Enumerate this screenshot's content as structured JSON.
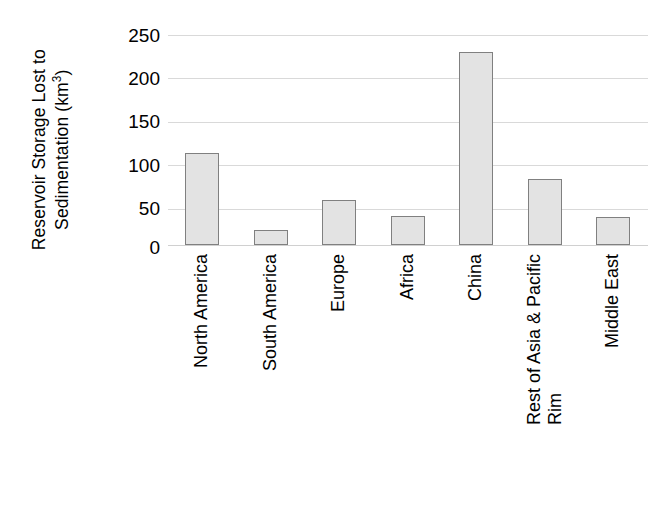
{
  "chart_data": {
    "type": "bar",
    "title": "",
    "subtitle": "",
    "xlabel": "",
    "ylabel": "Reservoir Storage Lost to Sedimentation (km3)",
    "ylabel_lines": [
      "Reservoir Storage Lost to",
      "Sedimentation (km"
    ],
    "ylabel_unit_exponent": "3",
    "ylabel_unit_close": ")",
    "categories": [
      "North America",
      "South America",
      "Europe",
      "Africa",
      "China",
      "Rest of Asia & Pacific Rim",
      "Middle East"
    ],
    "category_label_lines": [
      [
        "North America"
      ],
      [
        "South America"
      ],
      [
        "Europe"
      ],
      [
        "Africa"
      ],
      [
        "China"
      ],
      [
        "Rest of Asia & Pacific",
        "Rim"
      ],
      [
        "Middle East"
      ]
    ],
    "values": [
      110,
      18,
      54,
      34,
      230,
      78,
      33
    ],
    "ylim": [
      0,
      250
    ],
    "yticks": [
      0,
      50,
      100,
      150,
      200,
      250
    ],
    "ytick_labels": [
      "0",
      "50",
      "100",
      "150",
      "200",
      "250"
    ],
    "grid": true,
    "grid_axis": "y",
    "legend": false,
    "legend_position": "none",
    "colors": {
      "bar_fill": "#e3e3e3",
      "bar_border": "#808080",
      "gridline": "#d9d9d9",
      "text": "#000000",
      "background": "#ffffff"
    }
  }
}
